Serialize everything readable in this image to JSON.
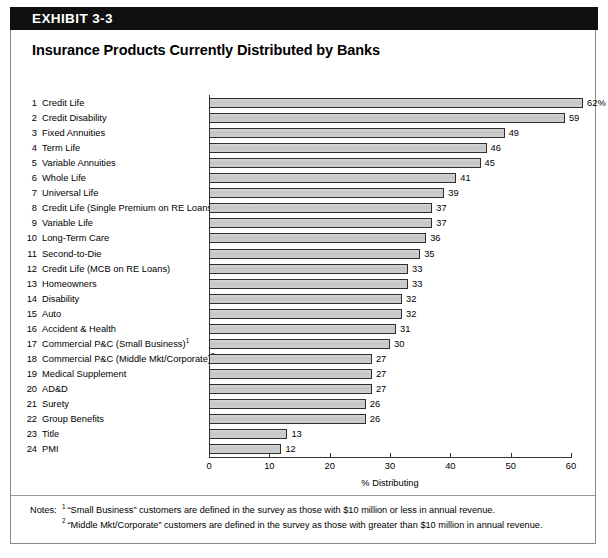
{
  "exhibit": {
    "banner_label": "EXHIBIT 3-3",
    "title": "Insurance Products Currently Distributed by Banks"
  },
  "notes": {
    "heading": "Notes:",
    "items": [
      {
        "marker": "1",
        "text": "“Small Business” customers are defined in the survey as those with $10 million or less in annual revenue."
      },
      {
        "marker": "2",
        "text": "“Middle Mkt/Corporate” customers are defined in the survey as those with greater than $10 million in annual revenue."
      }
    ]
  },
  "chart_data": {
    "type": "bar",
    "orientation": "horizontal",
    "title": "Insurance Products Currently Distributed by Banks",
    "xlabel": "% Distributing",
    "ylabel": "",
    "xlim": [
      0,
      60
    ],
    "xticks": [
      0,
      10,
      20,
      30,
      40,
      50,
      60
    ],
    "grid": false,
    "legend": null,
    "bar_color": "#c9c9c9",
    "bar_edge_color": "#2e2e2e",
    "categories": [
      "Credit Life",
      "Credit Disability",
      "Fixed Annuities",
      "Term Life",
      "Variable Annuities",
      "Whole Life",
      "Universal Life",
      "Credit Life (Single Premium on RE Loans)",
      "Variable Life",
      "Long-Term Care",
      "Second-to-Die",
      "Credit Life (MCB on RE Loans)",
      "Homeowners",
      "Disability",
      "Auto",
      "Accident & Health",
      "Commercial P&C (Small Business)",
      "Commercial P&C (Middle Mkt/Corporate)",
      "Medical Supplement",
      "AD&D",
      "Surety",
      "Group Benefits",
      "Title",
      "PMI"
    ],
    "ranks": [
      1,
      2,
      3,
      4,
      5,
      6,
      7,
      8,
      9,
      10,
      11,
      12,
      13,
      14,
      15,
      16,
      17,
      18,
      19,
      20,
      21,
      22,
      23,
      24
    ],
    "category_footnotes": [
      "",
      "",
      "",
      "",
      "",
      "",
      "",
      "",
      "",
      "",
      "",
      "",
      "",
      "",
      "",
      "",
      "1",
      "2",
      "",
      "",
      "",
      "",
      "",
      ""
    ],
    "values": [
      62,
      59,
      49,
      46,
      45,
      41,
      39,
      37,
      37,
      36,
      35,
      33,
      33,
      32,
      32,
      31,
      30,
      27,
      27,
      27,
      26,
      26,
      13,
      12
    ],
    "value_labels": [
      "62%",
      "59",
      "49",
      "46",
      "45",
      "41",
      "39",
      "37",
      "37",
      "36",
      "35",
      "33",
      "33",
      "32",
      "32",
      "31",
      "30",
      "27",
      "27",
      "27",
      "26",
      "26",
      "13",
      "12"
    ]
  }
}
